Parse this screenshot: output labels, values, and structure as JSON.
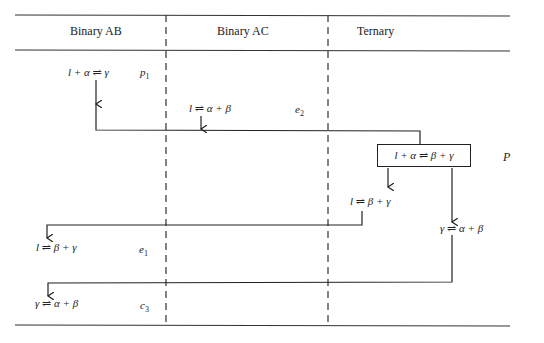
{
  "table": {
    "columns": [
      "Binary AB",
      "Binary AC",
      "Ternary"
    ]
  },
  "reactions": {
    "p1": {
      "equation": "l + α ⇌ γ",
      "label": "p",
      "sub": "1"
    },
    "e2": {
      "equation": "l ⇌ α + β",
      "label": "e",
      "sub": "2"
    },
    "P": {
      "equation": "l + α ⇌ β + γ",
      "label": "P"
    },
    "ternary_left": {
      "equation": "l ⇌ β + γ"
    },
    "ternary_right": {
      "equation": "γ ⇌ α + β"
    },
    "e1": {
      "equation": "l ⇌ β + γ",
      "label": "e",
      "sub": "1"
    },
    "c3": {
      "equation": "γ ⇌ α + β",
      "label": "c",
      "sub": "3"
    }
  }
}
